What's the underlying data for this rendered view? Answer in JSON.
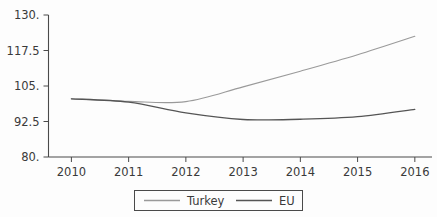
{
  "chart_data": {
    "type": "line",
    "title": "",
    "subtitle": "",
    "xlabel": "",
    "ylabel": "",
    "x": [
      2010,
      2011,
      2012,
      2013,
      2014,
      2015,
      2016
    ],
    "xtick_labels": [
      "2010",
      "2011",
      "2012",
      "2013",
      "2014",
      "2015",
      "2016"
    ],
    "ytick_labels": [
      "80.",
      "92.5",
      "105.",
      "117.5",
      "130."
    ],
    "ytick_values": [
      80,
      92.5,
      105,
      117.5,
      130
    ],
    "xlim": [
      2009.6,
      2016.3
    ],
    "ylim": [
      80,
      130
    ],
    "grid": false,
    "legend_position": "bottom-center",
    "series": [
      {
        "name": "Turkey",
        "color": "#9a9a9a",
        "width": 1.1,
        "values": [
          100.5,
          99.6,
          99.5,
          104.7,
          110.2,
          116.0,
          122.5
        ]
      },
      {
        "name": "EU",
        "color": "#555555",
        "width": 1.3,
        "values": [
          100.5,
          99.3,
          95.5,
          93.2,
          93.3,
          94.2,
          96.8
        ]
      }
    ]
  },
  "legend": {
    "entries": [
      {
        "label": "Turkey"
      },
      {
        "label": "EU"
      }
    ]
  },
  "colors": {
    "background": "#fdfdfd",
    "axis": "#4a4a4a",
    "text": "#3a3a3a",
    "series_turkey": "#9a9a9a",
    "series_eu": "#555555"
  }
}
